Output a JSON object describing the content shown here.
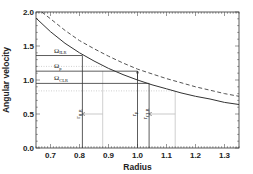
{
  "chart_data": {
    "type": "line",
    "title": "",
    "xlabel": "Radius",
    "ylabel": "Angular velocity",
    "xlim": [
      0.65,
      1.35
    ],
    "ylim": [
      0.0,
      2.0
    ],
    "xticks": [
      "0.7",
      "0.8",
      "0.9",
      "1.0",
      "1.1",
      "1.2",
      "1.3"
    ],
    "xtick_values": [
      0.7,
      0.8,
      0.9,
      1.0,
      1.1,
      1.2,
      1.3
    ],
    "yticks": [
      "0.0",
      "0.5",
      "1.0",
      "1.5",
      "2.0"
    ],
    "ytick_values": [
      0.0,
      0.5,
      1.0,
      1.5,
      2.0
    ],
    "grid": false,
    "legend": null,
    "series": [
      {
        "name": "Omega (solid)",
        "style": "solid",
        "x": [
          0.65,
          0.7,
          0.75,
          0.8,
          0.85,
          0.9,
          0.95,
          1.0,
          1.05,
          1.1,
          1.15,
          1.2,
          1.25,
          1.3,
          1.35
        ],
        "values": [
          1.91,
          1.71,
          1.54,
          1.4,
          1.28,
          1.17,
          1.08,
          1.0,
          0.93,
          0.87,
          0.81,
          0.76,
          0.72,
          0.67,
          0.64
        ]
      },
      {
        "name": "dashed curve",
        "style": "dashed",
        "x": [
          0.67,
          0.7,
          0.75,
          0.8,
          0.85,
          0.9,
          0.95,
          1.0,
          1.05,
          1.1,
          1.15,
          1.2,
          1.25,
          1.3,
          1.35
        ],
        "values": [
          2.0,
          1.9,
          1.73,
          1.58,
          1.46,
          1.35,
          1.25,
          1.16,
          1.09,
          1.02,
          0.96,
          0.9,
          0.85,
          0.8,
          0.76
        ]
      }
    ],
    "annotations": {
      "levels": [
        {
          "label": "Ω",
          "sub": "ILR",
          "y": 1.36,
          "x_end": 0.81,
          "style": "solid"
        },
        {
          "label": "",
          "sub": "",
          "y": 1.2,
          "x_end": 0.88,
          "style": "dotted"
        },
        {
          "label": "Ω",
          "sub": "p",
          "y": 1.13,
          "x_end": 1.0,
          "style": "solid"
        },
        {
          "label": "Ω",
          "sub": "CLR",
          "y": 0.95,
          "x_end": 1.04,
          "style": "solid"
        },
        {
          "label": "",
          "sub": "",
          "y": 0.84,
          "x_end": 1.13,
          "style": "dotted"
        }
      ],
      "radii": [
        {
          "label": "r",
          "sub": "ILR",
          "x": 0.81,
          "y_top": 1.36,
          "style": "solid"
        },
        {
          "label": "",
          "sub": "",
          "x": 0.88,
          "y_top": 1.13,
          "style": "dotted"
        },
        {
          "label": "r",
          "sub": "p",
          "x": 1.0,
          "y_top": 1.13,
          "style": "solid"
        },
        {
          "label": "r",
          "sub": "CLR",
          "x": 1.04,
          "y_top": 0.95,
          "style": "solid"
        },
        {
          "label": "",
          "sub": "",
          "x": 1.13,
          "y_top": 0.84,
          "style": "dotted"
        }
      ],
      "arrows": [
        {
          "from": [
            0.88,
            0.5
          ],
          "to": [
            0.81,
            0.5
          ]
        },
        {
          "from": [
            1.13,
            0.5
          ],
          "to": [
            1.04,
            0.5
          ]
        },
        {
          "from": [
            1.0,
            1.0
          ],
          "to": [
            1.0,
            1.13
          ]
        }
      ]
    },
    "colors": {
      "solid": "#333333",
      "dashed": "#555555",
      "dotted": "#bbbbbb",
      "frame": "#333333"
    }
  }
}
